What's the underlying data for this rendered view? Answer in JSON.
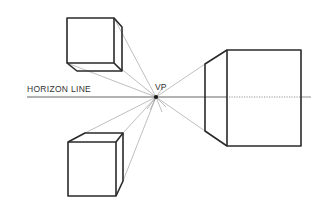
{
  "diagram": {
    "labels": {
      "horizon": "HORIZON LINE",
      "vanishing_point": "VP"
    },
    "colors": {
      "stroke": "#2a2a2a",
      "guide": "#8a8a8a",
      "background": "#ffffff"
    },
    "vanishing_point": {
      "x": 156,
      "y": 97
    },
    "horizon_y": 97,
    "objects": [
      {
        "name": "cube-above-horizon",
        "position": "upper-left"
      },
      {
        "name": "cube-below-horizon",
        "position": "lower-left"
      },
      {
        "name": "box-on-horizon",
        "position": "right"
      }
    ]
  }
}
